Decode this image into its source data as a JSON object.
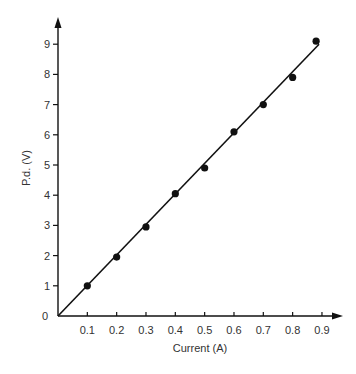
{
  "chart_data": {
    "type": "scatter",
    "title": "",
    "xlabel": "Current (A)",
    "ylabel": "P.d. (V)",
    "xlim": [
      0,
      0.95
    ],
    "ylim": [
      0,
      9.5
    ],
    "grid": false,
    "legend": null,
    "x_ticks": [
      "0.1",
      "0.2",
      "0.3",
      "0.4",
      "0.5",
      "0.6",
      "0.7",
      "0.8",
      "0.9"
    ],
    "y_ticks": [
      "0",
      "1",
      "2",
      "3",
      "4",
      "5",
      "6",
      "7",
      "8",
      "9"
    ],
    "series": [
      {
        "name": "measurements",
        "marker": "filled-circle",
        "x": [
          0.1,
          0.2,
          0.3,
          0.4,
          0.5,
          0.6,
          0.7,
          0.8,
          0.88
        ],
        "y": [
          1.0,
          1.95,
          2.95,
          4.05,
          4.9,
          6.1,
          7.0,
          7.9,
          9.1
        ]
      }
    ],
    "best_fit_line": {
      "from": [
        0,
        0
      ],
      "to": [
        0.89,
        9.0
      ]
    },
    "color": "#111111"
  }
}
